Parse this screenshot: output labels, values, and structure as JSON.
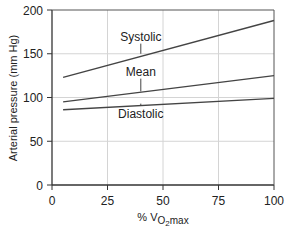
{
  "chart_data": {
    "type": "line",
    "title": "",
    "xlabel": "% VO2max",
    "xlabel_parts": {
      "prefix": "% V",
      "sub": "O",
      "subsub": "2",
      "suffix": "max"
    },
    "ylabel": "Arterial pressure (mm Hg)",
    "xlim": [
      0,
      100
    ],
    "ylim": [
      0,
      200
    ],
    "xticks": [
      0,
      25,
      50,
      75,
      100
    ],
    "yticks": [
      0,
      50,
      100,
      150,
      200
    ],
    "grid": true,
    "legend": "inline labels",
    "x": [
      5,
      100
    ],
    "series": [
      {
        "name": "Systolic",
        "values": [
          123,
          188
        ],
        "label_x": 40,
        "label_y": 165,
        "pointer_to_y": 150
      },
      {
        "name": "Mean",
        "values": [
          95,
          125
        ],
        "label_x": 40,
        "label_y": 125,
        "pointer_to_y": 107
      },
      {
        "name": "Diastolic",
        "values": [
          86,
          99
        ],
        "label_x": 40,
        "label_y": 77,
        "pointer_to_y": 93
      }
    ]
  }
}
